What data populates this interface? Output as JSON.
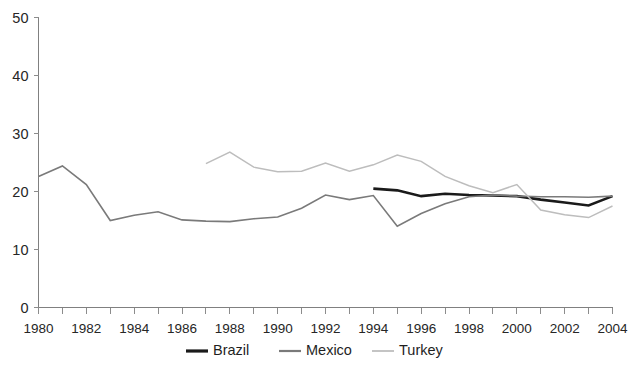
{
  "chart_data": {
    "type": "line",
    "title": "",
    "subtitle": "",
    "xlabel": "",
    "ylabel": "",
    "xlim": [
      1980,
      2004
    ],
    "ylim": [
      0,
      50
    ],
    "y_ticks": [
      0,
      10,
      20,
      30,
      40,
      50
    ],
    "y_tick_labels": [
      "0",
      "10",
      "20",
      "30",
      "40",
      "50"
    ],
    "x_ticks": [
      1980,
      1981,
      1982,
      1983,
      1984,
      1985,
      1986,
      1987,
      1988,
      1989,
      1990,
      1991,
      1992,
      1993,
      1994,
      1995,
      1996,
      1997,
      1998,
      1999,
      2000,
      2001,
      2002,
      2003,
      2004
    ],
    "x_tick_labels": [
      "1980",
      "",
      "1982",
      "",
      "1984",
      "",
      "1986",
      "",
      "1988",
      "",
      "1990",
      "",
      "1992",
      "",
      "1994",
      "",
      "1996",
      "",
      "1998",
      "",
      "2000",
      "",
      "2002",
      "",
      "2004"
    ],
    "x_labeled_ticks": [
      1980,
      1982,
      1984,
      1986,
      1988,
      1990,
      1992,
      1994,
      1996,
      1998,
      2000,
      2002,
      2004
    ],
    "grid": false,
    "legend_position": "bottom",
    "series": [
      {
        "name": "Brazil",
        "color": "#1a1a1a",
        "width": 2.6,
        "x": [
          1994,
          1995,
          1996,
          1997,
          1998,
          1999,
          2000,
          2001,
          2002,
          2003,
          2004
        ],
        "values": [
          20.5,
          20.2,
          19.2,
          19.6,
          19.4,
          19.3,
          19.2,
          18.6,
          18.1,
          17.6,
          19.2
        ]
      },
      {
        "name": "Mexico",
        "color": "#7a7a7a",
        "width": 1.6,
        "x": [
          1980,
          1981,
          1982,
          1983,
          1984,
          1985,
          1986,
          1987,
          1988,
          1989,
          1990,
          1991,
          1992,
          1993,
          1994,
          1995,
          1996,
          1997,
          1998,
          1999,
          2000,
          2001,
          2002,
          2003,
          2004
        ],
        "values": [
          22.6,
          24.4,
          21.2,
          15.0,
          15.9,
          16.5,
          15.1,
          14.9,
          14.8,
          15.3,
          15.6,
          17.1,
          19.4,
          18.6,
          19.3,
          14.0,
          16.2,
          17.9,
          19.1,
          19.4,
          19.2,
          19.1,
          19.1,
          19.0,
          19.2
        ]
      },
      {
        "name": "Turkey",
        "color": "#bdbdbd",
        "width": 1.5,
        "x": [
          1987,
          1988,
          1989,
          1990,
          1991,
          1992,
          1993,
          1994,
          1995,
          1996,
          1997,
          1998,
          1999,
          2000,
          2001,
          2002,
          2003,
          2004
        ],
        "values": [
          24.8,
          26.8,
          24.2,
          23.4,
          23.5,
          24.9,
          23.5,
          24.6,
          26.3,
          25.2,
          22.6,
          21.0,
          19.8,
          21.2,
          16.8,
          16.0,
          15.5,
          17.5
        ]
      }
    ],
    "legend": [
      {
        "label": "Brazil",
        "color": "#1a1a1a",
        "width": 3.2
      },
      {
        "label": "Mexico",
        "color": "#7a7a7a",
        "width": 2.2
      },
      {
        "label": "Turkey",
        "color": "#c4c4c4",
        "width": 2.0
      }
    ]
  },
  "colors": {
    "background": "#ffffff",
    "axis": "#808080",
    "tick": "#8c8c8c",
    "text": "#262626",
    "brazil": "#1a1a1a",
    "mexico": "#7a7a7a",
    "turkey": "#bdbdbd"
  }
}
